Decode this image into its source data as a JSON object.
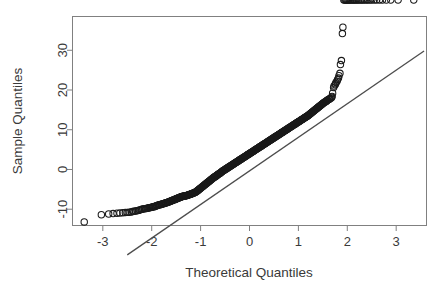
{
  "figure": {
    "name": "normal-qq-plot",
    "background_color": "#ffffff",
    "box_color": "#808080",
    "axis_color": "#808080",
    "point_color": "#1a1a1a",
    "line_color": "#4d4d4d"
  },
  "chart_data": {
    "type": "scatter",
    "title": "",
    "xlabel": "Theoretical Quantiles",
    "ylabel": "Sample Quantiles",
    "xlim": [
      -3.62,
      3.62
    ],
    "ylim": [
      -14.1,
      38.5
    ],
    "xticks": [
      -3,
      -2,
      -1,
      0,
      1,
      2,
      3
    ],
    "xtick_labels": [
      "-3",
      "-2",
      "-1",
      "0",
      "1",
      "2",
      "3"
    ],
    "yticks": [
      -10,
      0,
      10,
      20,
      30
    ],
    "ytick_labels": [
      "-10",
      "0",
      "10",
      "20",
      "30"
    ],
    "grid": false,
    "legend": null,
    "marker": "open-circle",
    "marker_size": 3.2,
    "reference_line": {
      "name": "qqline",
      "slope": 8.45,
      "intercept": -0.35,
      "x_start": -2.5,
      "y_start": -21.5,
      "x_end": 3.57,
      "y_end": 29.8,
      "color": "#4d4d4d",
      "width": 1.3
    },
    "annotations": [
      "upper tail curves above the reference line",
      "lower tail flattens above the reference line"
    ],
    "x": [
      -3.38,
      -3.03,
      -2.88,
      -2.79,
      -2.71,
      -2.65,
      -2.59,
      -2.54,
      -2.5,
      -2.46,
      -2.42,
      -2.39,
      -2.36,
      -2.33,
      -2.3,
      -2.27,
      -2.25,
      -2.22,
      -2.2,
      -2.18,
      -2.15,
      -2.13,
      -2.11,
      -2.09,
      -2.07,
      -2.05,
      -2.04,
      -2.02,
      -2.0,
      -1.98,
      -1.97,
      -1.95,
      -1.93,
      -1.92,
      -1.9,
      -1.89,
      -1.87,
      -1.86,
      -1.84,
      -1.83,
      -1.81,
      -1.8,
      -1.79,
      -1.77,
      -1.76,
      -1.75,
      -1.73,
      -1.72,
      -1.71,
      -1.7,
      -1.68,
      -1.67,
      -1.66,
      -1.65,
      -1.64,
      -1.62,
      -1.61,
      -1.6,
      -1.59,
      -1.58,
      -1.57,
      -1.56,
      -1.55,
      -1.53,
      -1.52,
      -1.51,
      -1.5,
      -1.49,
      -1.48,
      -1.47,
      -1.46,
      -1.45,
      -1.44,
      -1.43,
      -1.42,
      -1.41,
      -1.4,
      -1.39,
      -1.38,
      -1.37,
      -1.36,
      -1.35,
      -1.34,
      -1.33,
      -1.32,
      -1.31,
      -1.3,
      -1.29,
      -1.28,
      -1.27,
      -1.26,
      -1.25,
      -1.24,
      -1.23,
      -1.22,
      -1.21,
      -1.2,
      -1.19,
      -1.18,
      -1.17,
      -1.16,
      -1.15,
      -1.14,
      -1.13,
      -1.12,
      -1.11,
      -1.1,
      -1.09,
      -1.08,
      -1.07,
      -1.06,
      -1.05,
      -1.04,
      -1.03,
      -1.02,
      -1.01,
      -1.0,
      -0.99,
      -0.98,
      -0.97,
      -0.96,
      -0.95,
      -0.94,
      -0.93,
      -0.92,
      -0.91,
      -0.9,
      -0.89,
      -0.88,
      -0.87,
      -0.86,
      -0.85,
      -0.84,
      -0.83,
      -0.82,
      -0.81,
      -0.8,
      -0.79,
      -0.78,
      -0.77,
      -0.76,
      -0.75,
      -0.74,
      -0.73,
      -0.72,
      -0.71,
      -0.7,
      -0.69,
      -0.68,
      -0.67,
      -0.66,
      -0.65,
      -0.64,
      -0.63,
      -0.62,
      -0.61,
      -0.6,
      -0.59,
      -0.58,
      -0.57,
      -0.56,
      -0.55,
      -0.54,
      -0.53,
      -0.52,
      -0.51,
      -0.5,
      -0.49,
      -0.48,
      -0.47,
      -0.46,
      -0.45,
      -0.44,
      -0.43,
      -0.42,
      -0.41,
      -0.4,
      -0.39,
      -0.38,
      -0.37,
      -0.36,
      -0.35,
      -0.34,
      -0.33,
      -0.32,
      -0.31,
      -0.3,
      -0.29,
      -0.28,
      -0.27,
      -0.26,
      -0.25,
      -0.24,
      -0.23,
      -0.22,
      -0.21,
      -0.2,
      -0.19,
      -0.18,
      -0.17,
      -0.16,
      -0.15,
      -0.14,
      -0.13,
      -0.12,
      -0.11,
      -0.1,
      -0.09,
      -0.08,
      -0.07,
      -0.06,
      -0.05,
      -0.04,
      -0.03,
      -0.02,
      -0.01,
      0.0,
      0.01,
      0.02,
      0.03,
      0.04,
      0.05,
      0.06,
      0.07,
      0.08,
      0.09,
      0.1,
      0.11,
      0.12,
      0.13,
      0.14,
      0.15,
      0.16,
      0.17,
      0.18,
      0.19,
      0.2,
      0.21,
      0.22,
      0.23,
      0.24,
      0.25,
      0.26,
      0.27,
      0.28,
      0.29,
      0.3,
      0.31,
      0.32,
      0.33,
      0.34,
      0.35,
      0.36,
      0.37,
      0.38,
      0.39,
      0.4,
      0.41,
      0.42,
      0.43,
      0.44,
      0.45,
      0.46,
      0.47,
      0.48,
      0.49,
      0.5,
      0.51,
      0.52,
      0.53,
      0.54,
      0.55,
      0.56,
      0.57,
      0.58,
      0.59,
      0.6,
      0.61,
      0.62,
      0.63,
      0.64,
      0.65,
      0.66,
      0.67,
      0.68,
      0.69,
      0.7,
      0.71,
      0.72,
      0.73,
      0.74,
      0.75,
      0.76,
      0.77,
      0.78,
      0.79,
      0.8,
      0.81,
      0.82,
      0.83,
      0.84,
      0.85,
      0.86,
      0.87,
      0.88,
      0.89,
      0.9,
      0.91,
      0.92,
      0.93,
      0.94,
      0.95,
      0.96,
      0.97,
      0.98,
      0.99,
      1.0,
      1.01,
      1.02,
      1.03,
      1.04,
      1.05,
      1.06,
      1.07,
      1.08,
      1.09,
      1.1,
      1.11,
      1.12,
      1.13,
      1.14,
      1.15,
      1.16,
      1.17,
      1.18,
      1.19,
      1.2,
      1.21,
      1.22,
      1.23,
      1.24,
      1.25,
      1.26,
      1.27,
      1.28,
      1.29,
      1.3,
      1.31,
      1.32,
      1.33,
      1.34,
      1.35,
      1.36,
      1.37,
      1.38,
      1.39,
      1.4,
      1.41,
      1.42,
      1.43,
      1.44,
      1.45,
      1.46,
      1.47,
      1.48,
      1.49,
      1.5,
      1.51,
      1.52,
      1.53,
      1.55,
      1.56,
      1.57,
      1.58,
      1.59,
      1.6,
      1.62,
      1.63,
      1.64,
      1.65,
      1.67,
      1.68,
      1.69,
      1.7,
      1.72,
      1.73,
      1.75,
      1.76,
      1.77,
      1.79,
      1.8,
      1.82,
      1.83,
      1.85,
      1.86,
      1.88,
      1.9,
      1.91,
      1.93,
      1.95,
      1.97,
      1.98,
      2.0,
      2.02,
      2.04,
      2.06,
      2.08,
      2.11,
      2.13,
      2.15,
      2.18,
      2.2,
      2.23,
      2.26,
      2.29,
      2.32,
      2.35,
      2.39,
      2.42,
      2.46,
      2.5,
      2.55,
      2.6,
      2.66,
      2.72,
      2.8,
      2.89,
      3.04,
      3.36
    ],
    "y": [
      -13.2,
      -11.4,
      -11.2,
      -11.1,
      -11.0,
      -10.95,
      -10.9,
      -10.85,
      -10.8,
      -10.75,
      -10.7,
      -10.6,
      -10.5,
      -10.45,
      -10.4,
      -10.3,
      -10.2,
      -10.1,
      -10.0,
      -9.95,
      -9.9,
      -9.85,
      -9.8,
      -9.75,
      -9.7,
      -9.65,
      -9.6,
      -9.55,
      -9.5,
      -9.45,
      -9.4,
      -9.35,
      -9.3,
      -9.2,
      -9.1,
      -9.05,
      -9.0,
      -8.95,
      -8.9,
      -8.85,
      -8.8,
      -8.75,
      -8.7,
      -8.65,
      -8.6,
      -8.55,
      -8.5,
      -8.45,
      -8.4,
      -8.35,
      -8.3,
      -8.25,
      -8.2,
      -8.15,
      -8.1,
      -8.0,
      -7.95,
      -7.9,
      -7.85,
      -7.8,
      -7.75,
      -7.7,
      -7.65,
      -7.6,
      -7.5,
      -7.45,
      -7.4,
      -7.35,
      -7.3,
      -7.25,
      -7.2,
      -7.15,
      -7.1,
      -7.05,
      -7.0,
      -6.95,
      -6.9,
      -6.85,
      -6.8,
      -6.78,
      -6.75,
      -6.72,
      -6.7,
      -6.68,
      -6.65,
      -6.62,
      -6.6,
      -6.58,
      -6.55,
      -6.5,
      -6.45,
      -6.4,
      -6.35,
      -6.3,
      -6.28,
      -6.25,
      -6.2,
      -6.15,
      -6.1,
      -6.05,
      -6.0,
      -5.95,
      -5.9,
      -5.85,
      -5.8,
      -5.75,
      -5.7,
      -5.6,
      -5.5,
      -5.4,
      -5.3,
      -5.2,
      -5.1,
      -5.0,
      -4.9,
      -4.8,
      -4.7,
      -4.6,
      -4.5,
      -4.4,
      -4.3,
      -4.2,
      -4.1,
      -4.0,
      -3.9,
      -3.8,
      -3.7,
      -3.6,
      -3.5,
      -3.4,
      -3.3,
      -3.2,
      -3.1,
      -3.0,
      -2.9,
      -2.8,
      -2.7,
      -2.6,
      -2.5,
      -2.4,
      -2.3,
      -2.2,
      -2.1,
      -2.0,
      -1.9,
      -1.85,
      -1.8,
      -1.7,
      -1.6,
      -1.5,
      -1.4,
      -1.3,
      -1.2,
      -1.1,
      -1.05,
      -1.0,
      -0.9,
      -0.8,
      -0.7,
      -0.6,
      -0.5,
      -0.4,
      -0.3,
      -0.25,
      -0.2,
      -0.1,
      0.0,
      0.1,
      0.15,
      0.2,
      0.3,
      0.4,
      0.5,
      0.55,
      0.6,
      0.7,
      0.8,
      0.9,
      0.95,
      1.0,
      1.1,
      1.2,
      1.3,
      1.35,
      1.4,
      1.5,
      1.6,
      1.7,
      1.75,
      1.8,
      1.9,
      2.0,
      2.1,
      2.15,
      2.2,
      2.3,
      2.4,
      2.5,
      2.55,
      2.6,
      2.7,
      2.8,
      2.9,
      2.95,
      3.0,
      3.1,
      3.2,
      3.3,
      3.35,
      3.4,
      3.5,
      3.6,
      3.7,
      3.75,
      3.8,
      3.9,
      4.0,
      4.1,
      4.15,
      4.2,
      4.3,
      4.4,
      4.5,
      4.55,
      4.6,
      4.7,
      4.8,
      4.9,
      4.95,
      5.0,
      5.1,
      5.2,
      5.3,
      5.35,
      5.4,
      5.5,
      5.6,
      5.7,
      5.75,
      5.8,
      5.9,
      6.0,
      6.1,
      6.15,
      6.2,
      6.3,
      6.4,
      6.5,
      6.55,
      6.6,
      6.7,
      6.8,
      6.9,
      6.95,
      7.0,
      7.1,
      7.2,
      7.3,
      7.35,
      7.4,
      7.5,
      7.6,
      7.7,
      7.75,
      7.8,
      7.9,
      8.0,
      8.1,
      8.15,
      8.2,
      8.3,
      8.4,
      8.5,
      8.55,
      8.6,
      8.7,
      8.8,
      8.9,
      8.95,
      9.0,
      9.1,
      9.2,
      9.3,
      9.35,
      9.4,
      9.5,
      9.6,
      9.7,
      9.75,
      9.8,
      9.9,
      10.0,
      10.1,
      10.15,
      10.2,
      10.3,
      10.4,
      10.5,
      10.55,
      10.6,
      10.7,
      10.8,
      10.9,
      10.95,
      11.0,
      11.1,
      11.2,
      11.3,
      11.35,
      11.4,
      11.5,
      11.6,
      11.7,
      11.75,
      11.8,
      11.9,
      12.0,
      12.1,
      12.15,
      12.2,
      12.3,
      12.4,
      12.5,
      12.55,
      12.6,
      12.7,
      12.8,
      12.9,
      12.95,
      13.0,
      13.1,
      13.2,
      13.3,
      13.35,
      13.4,
      13.5,
      13.6,
      13.7,
      13.8,
      13.9,
      14.0,
      14.1,
      14.2,
      14.3,
      14.4,
      14.5,
      14.6,
      14.7,
      14.8,
      14.9,
      15.0,
      15.1,
      15.2,
      15.3,
      15.4,
      15.5,
      15.6,
      15.7,
      15.8,
      15.9,
      16.0,
      16.1,
      16.2,
      16.3,
      16.4,
      16.5,
      16.6,
      16.7,
      16.8,
      16.9,
      17.0,
      17.1,
      17.2,
      17.3,
      17.4,
      17.5,
      17.6,
      17.7,
      17.8,
      17.9,
      18.0,
      18.2,
      18.4,
      19.2,
      20.6,
      21.0,
      21.3,
      21.6,
      21.9,
      22.2,
      22.6,
      23.0,
      23.6,
      24.2,
      26.4,
      27.4,
      34.2,
      35.8
    ]
  },
  "axis_titles": {
    "x": "Theoretical Quantiles",
    "y": "Sample Quantiles"
  }
}
